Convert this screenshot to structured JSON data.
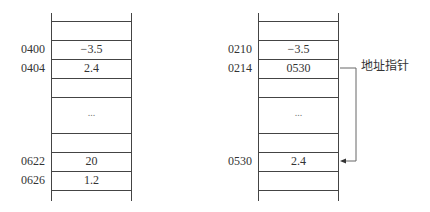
{
  "left_memory": {
    "cells": [
      {
        "address": "0400",
        "value": "−3.5"
      },
      {
        "address": "0404",
        "value": "2.4"
      },
      {
        "address": "",
        "value": "..."
      },
      {
        "address": "0622",
        "value": "20"
      },
      {
        "address": "0626",
        "value": "1.2"
      }
    ]
  },
  "right_memory": {
    "cells": [
      {
        "address": "0210",
        "value": "−3.5"
      },
      {
        "address": "0214",
        "value": "0530"
      },
      {
        "address": "",
        "value": "..."
      },
      {
        "address": "0530",
        "value": "2.4"
      }
    ]
  },
  "pointer_label": "地址指针"
}
